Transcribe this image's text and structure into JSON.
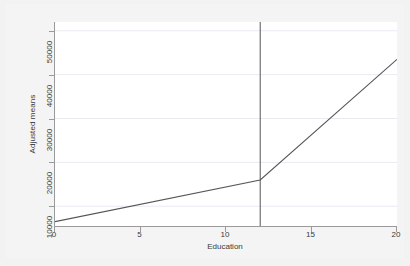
{
  "chart_data": {
    "type": "line",
    "title": "",
    "subtitle": "",
    "xlabel": "Education",
    "ylabel": "Adjusted means",
    "xlim": [
      0,
      20
    ],
    "ylim": [
      5500,
      52000
    ],
    "grid": true,
    "grid_axis": "y",
    "legend": "none",
    "x_ticks": [
      0,
      5,
      10,
      15,
      20
    ],
    "x_tick_labels": [
      "0",
      "5",
      "10",
      "15",
      "20"
    ],
    "y_ticks": [
      10000,
      20000,
      30000,
      40000,
      50000
    ],
    "y_tick_labels": [
      "10000",
      "20000",
      "30000",
      "40000",
      "50000"
    ],
    "series": [
      {
        "name": "Adjusted means",
        "type": "line",
        "color": "#555555",
        "x": [
          0,
          12,
          20
        ],
        "y": [
          6500,
          16000,
          43500
        ],
        "note": "piecewise-linear spline with knot at Education = 12"
      }
    ],
    "annotations": [
      {
        "name": "knot-reference-line",
        "type": "vertical-line",
        "x": 12,
        "color": "#555555",
        "label": ""
      }
    ]
  },
  "axes": {
    "x_title": "Education",
    "y_title": "Adjusted means"
  },
  "colors": {
    "page_background": "#f2f2f2",
    "plot_background": "#ffffff",
    "axis": "#9a9a9a",
    "gridline": "#eaeaf2",
    "data_line": "#555555",
    "reference_line": "#555555",
    "text": "#3a3a3a"
  }
}
